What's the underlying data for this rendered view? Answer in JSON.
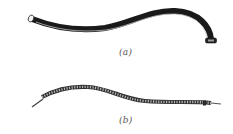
{
  "figure": {
    "panels": [
      {
        "id": "a",
        "label": "(a)",
        "description": "smooth jacketed flexible tube"
      },
      {
        "id": "b",
        "label": "(b)",
        "description": "braided flexible cable with exposed wire ends"
      }
    ]
  },
  "colors": {
    "background": "#ffffff",
    "tube_dark": "#1a1a1a",
    "tube_highlight": "#bfbfbf",
    "braid": "#6a6a6a",
    "braid_dark": "#2e2e2e",
    "label": "#555555"
  }
}
